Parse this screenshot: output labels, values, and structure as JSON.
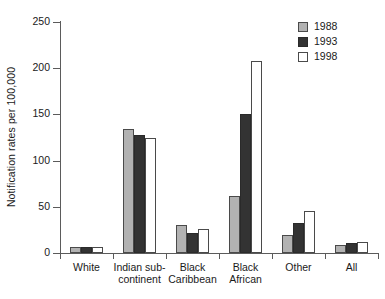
{
  "chart_data": {
    "type": "bar",
    "title": "",
    "xlabel": "",
    "ylabel": "Notification rates per 100,000",
    "ylim": [
      0,
      250
    ],
    "yticks": [
      0,
      50,
      100,
      150,
      200,
      250
    ],
    "grid": false,
    "legend_position": "top-right",
    "categories": [
      "White",
      "Indian sub-continent",
      "Black Caribbean",
      "Black African",
      "Other",
      "All"
    ],
    "category_label_lines": [
      [
        "White"
      ],
      [
        "Indian sub-",
        "continent"
      ],
      [
        "Black",
        "Caribbean"
      ],
      [
        "Black",
        "African"
      ],
      [
        "Other"
      ],
      [
        "All"
      ]
    ],
    "series": [
      {
        "name": "1988",
        "color": "#b2b2b2",
        "values": [
          7,
          134,
          30,
          62,
          20,
          9
        ]
      },
      {
        "name": "1993",
        "color": "#333333",
        "values": [
          7,
          128,
          22,
          150,
          33,
          11
        ]
      },
      {
        "name": "1998",
        "color": "#ffffff",
        "values": [
          7,
          124,
          26,
          208,
          45,
          12
        ]
      }
    ]
  },
  "legend": {
    "entries": [
      {
        "label": "1988",
        "swatch": "legend-swatch-1988"
      },
      {
        "label": "1993",
        "swatch": "legend-swatch-1993"
      },
      {
        "label": "1998",
        "swatch": "legend-swatch-1998"
      }
    ]
  },
  "axis": {
    "y_title": "Notification rates per 100,000",
    "y_tick_labels": [
      "0",
      "50",
      "100",
      "150",
      "200",
      "250"
    ]
  }
}
